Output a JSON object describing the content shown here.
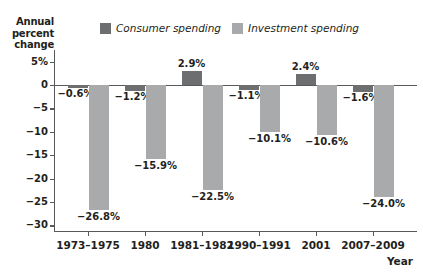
{
  "chart_data": {
    "type": "bar",
    "title": "",
    "ylabel": "Annual percent change",
    "ylabel_lines": [
      "Annual",
      "percent",
      "change"
    ],
    "xlabel": "Year",
    "categories": [
      "1973–1975",
      "1980",
      "1981–1982",
      "1990–1991",
      "2001",
      "2007–2009"
    ],
    "series": [
      {
        "name": "Consumer spending",
        "color": "#6d6e70",
        "values": [
          -0.6,
          -1.2,
          2.9,
          -1.1,
          2.4,
          -1.6
        ],
        "labels": [
          "−0.6%",
          "−1.2%",
          "2.9%",
          "−1.1%",
          "2.4%",
          "−1.6%"
        ]
      },
      {
        "name": "Investment spending",
        "color": "#a8aaac",
        "values": [
          -26.8,
          -15.9,
          -22.5,
          -10.1,
          -10.6,
          -24.0
        ],
        "labels": [
          "−26.8%",
          "−15.9%",
          "−22.5%",
          "−10.1%",
          "−10.6%",
          "−24.0%"
        ]
      }
    ],
    "ylim": [
      -30,
      7
    ],
    "yticks": [
      5,
      0,
      -5,
      -10,
      -15,
      -20,
      -25,
      -30
    ],
    "ytick_labels": [
      "5%",
      "0",
      "−5",
      "−10",
      "−15",
      "−20",
      "−25",
      "−30"
    ],
    "grid": false,
    "legend_position": "top-center",
    "legend": [
      "Consumer spending",
      "Investment spending"
    ]
  },
  "legend": {
    "consumer_label": "Consumer spending",
    "investment_label": "Investment spending"
  },
  "colors": {
    "consumer": "#6d6e70",
    "investment": "#a8aaac",
    "axis": "#58595b",
    "text": "#231f20",
    "background": "#ffffff"
  }
}
